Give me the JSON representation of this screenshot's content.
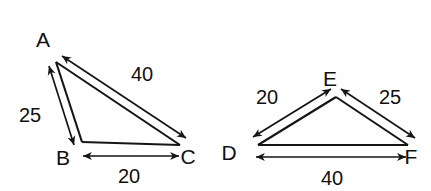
{
  "figure": {
    "type": "geometry-diagram",
    "background_color": "#ffffff",
    "stroke_color": "#151515",
    "text_color": "#101010"
  },
  "triangles": [
    {
      "id": "triangle-abc",
      "name": "Triangle ABC",
      "vertices": [
        {
          "label": "A",
          "x": 56,
          "y": 62,
          "label_x": 43,
          "label_y": 47
        },
        {
          "label": "B",
          "x": 82,
          "y": 142,
          "label_x": 63,
          "label_y": 165
        },
        {
          "label": "C",
          "x": 180,
          "y": 145,
          "label_x": 188,
          "label_y": 164
        }
      ],
      "sides": [
        {
          "id": "side-ab",
          "from": "A",
          "to": "B",
          "measure": "25",
          "label_x": 19,
          "label_y": 122
        },
        {
          "id": "side-ac",
          "from": "A",
          "to": "C",
          "measure": "40",
          "label_x": 131,
          "label_y": 81
        },
        {
          "id": "side-bc",
          "from": "B",
          "to": "C",
          "measure": "20",
          "label_x": 118,
          "label_y": 183
        }
      ]
    },
    {
      "id": "triangle-def",
      "name": "Triangle DEF",
      "vertices": [
        {
          "label": "D",
          "x": 258,
          "y": 145,
          "label_x": 229,
          "label_y": 160
        },
        {
          "label": "E",
          "x": 336,
          "y": 97,
          "label_x": 330,
          "label_y": 86
        },
        {
          "label": "F",
          "x": 408,
          "y": 145,
          "label_x": 411,
          "label_y": 164
        }
      ],
      "sides": [
        {
          "id": "side-de",
          "from": "D",
          "to": "E",
          "measure": "20",
          "label_x": 256,
          "label_y": 104
        },
        {
          "id": "side-ef",
          "from": "E",
          "to": "F",
          "measure": "25",
          "label_x": 379,
          "label_y": 104
        },
        {
          "id": "side-df",
          "from": "D",
          "to": "F",
          "measure": "40",
          "label_x": 321,
          "label_y": 185
        }
      ]
    }
  ]
}
